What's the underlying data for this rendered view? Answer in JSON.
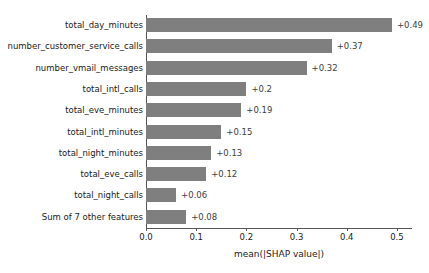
{
  "chart_data": {
    "type": "bar",
    "orientation": "horizontal",
    "title": "",
    "xlabel": "mean(|SHAP value|)",
    "ylabel": "",
    "xlim": [
      0.0,
      0.53
    ],
    "xticks": [
      "0.0",
      "0.1",
      "0.2",
      "0.3",
      "0.4",
      "0.5"
    ],
    "xtick_values": [
      0.0,
      0.1,
      0.2,
      0.3,
      0.4,
      0.5
    ],
    "grid": false,
    "legend": null,
    "bar_color": "#7f7f7f",
    "categories": [
      "total_day_minutes",
      "number_customer_service_calls",
      "number_vmail_messages",
      "total_intl_calls",
      "total_eve_minutes",
      "total_intl_minutes",
      "total_night_minutes",
      "total_eve_calls",
      "total_night_calls",
      "Sum of 7 other features"
    ],
    "values": [
      0.49,
      0.37,
      0.32,
      0.2,
      0.19,
      0.15,
      0.13,
      0.12,
      0.06,
      0.08
    ],
    "value_labels": [
      "+0.49",
      "+0.37",
      "+0.32",
      "+0.2",
      "+0.19",
      "+0.15",
      "+0.13",
      "+0.12",
      "+0.06",
      "+0.08"
    ]
  }
}
